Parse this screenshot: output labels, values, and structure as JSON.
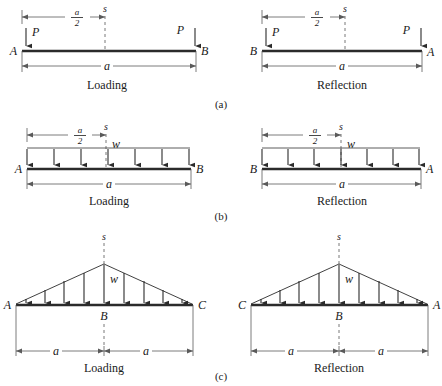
{
  "figure": {
    "subfigure_labels": [
      "(a)",
      "(b)",
      "(c)"
    ],
    "panel_captions": {
      "loading": "Loading",
      "reflection": "Reflection"
    },
    "symbols": {
      "point_load": "P",
      "distributed_load": "w",
      "section": "s",
      "span": "a",
      "half_span_numerator": "a",
      "half_span_denominator": "2"
    },
    "nodes": {
      "a": "A",
      "b": "B",
      "c": "C"
    }
  },
  "panels": [
    {
      "id": "a-loading",
      "group": "(a)",
      "caption": "Loading",
      "load_type": "point",
      "left_node": "A",
      "right_node": "B",
      "load_label": "P",
      "section_label": "s",
      "dim_top_label": "a/2",
      "dim_bottom_label": "a",
      "arrow_count": 2
    },
    {
      "id": "a-reflection",
      "group": "(a)",
      "caption": "Reflection",
      "load_type": "point",
      "left_node": "B",
      "right_node": "A",
      "load_label": "P",
      "section_label": "s",
      "dim_top_label": "a/2",
      "dim_bottom_label": "a",
      "arrow_count": 2
    },
    {
      "id": "b-loading",
      "group": "(b)",
      "caption": "Loading",
      "load_type": "uniform",
      "left_node": "A",
      "right_node": "B",
      "load_label": "w",
      "section_label": "s",
      "dim_top_label": "a/2",
      "dim_bottom_label": "a",
      "arrow_count": 7
    },
    {
      "id": "b-reflection",
      "group": "(b)",
      "caption": "Reflection",
      "load_type": "uniform",
      "left_node": "B",
      "right_node": "A",
      "load_label": "w",
      "section_label": "s",
      "dim_top_label": "a/2",
      "dim_bottom_label": "a",
      "arrow_count": 7
    },
    {
      "id": "c-loading",
      "group": "(c)",
      "caption": "Loading",
      "load_type": "triangular",
      "left_node": "A",
      "center_node": "B",
      "right_node": "C",
      "load_label": "w",
      "section_label": "s",
      "dim_left_label": "a",
      "dim_right_label": "a",
      "arrow_count": 9
    },
    {
      "id": "c-reflection",
      "group": "(c)",
      "caption": "Reflection",
      "load_type": "triangular",
      "left_node": "C",
      "center_node": "B",
      "right_node": "A",
      "load_label": "w",
      "section_label": "s",
      "dim_left_label": "a",
      "dim_right_label": "a",
      "arrow_count": 9
    }
  ]
}
